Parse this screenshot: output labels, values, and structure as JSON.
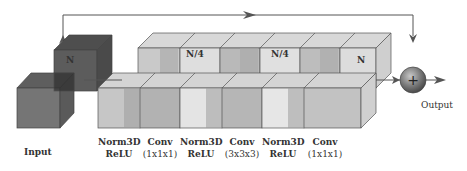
{
  "diagram": {
    "input_label": "Input",
    "output_label": "Output",
    "channel_labels": {
      "input_block": "N",
      "bottleneck_1": "N/4",
      "bottleneck_2": "N/4",
      "output_block": "N"
    },
    "layers": [
      {
        "line1": "Norm3D",
        "line2": "ReLU"
      },
      {
        "line1": "Conv",
        "line2": "(1x1x1)"
      },
      {
        "line1": "Norm3D",
        "line2": "ReLU"
      },
      {
        "line1": "Conv",
        "line2": "(3x3x3)"
      },
      {
        "line1": "Norm3D",
        "line2": "ReLU"
      },
      {
        "line1": "Conv",
        "line2": "(1x1x1)"
      }
    ],
    "sum_node": "+",
    "colors": {
      "input_cube": "#6e6e6e",
      "n_cube": "#5a5a5a",
      "light_block": "#d0d0d0",
      "mid_block": "#a8a8a8",
      "edge": "#444444",
      "arrow": "#555555",
      "sum_node": "#707070"
    }
  }
}
